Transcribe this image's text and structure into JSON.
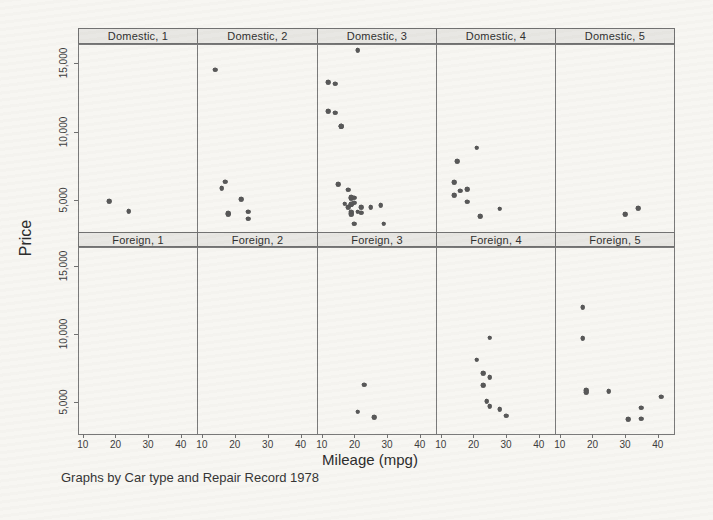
{
  "chart_data": {
    "type": "scatter",
    "xlabel": "Mileage (mpg)",
    "ylabel": "Price",
    "caption": "Graphs by Car type and Repair Record 1978",
    "x_ticks": [
      10,
      20,
      30,
      40
    ],
    "y_ticks": [
      5000,
      10000,
      15000
    ],
    "y_tick_labels": [
      "5,000",
      "10,000",
      "15,000"
    ],
    "xlim": [
      8.5,
      45
    ],
    "ylim": [
      2700,
      16400
    ],
    "grid": false,
    "legend": "none",
    "facet_rows": [
      "Domestic",
      "Foreign"
    ],
    "facet_cols": [
      "1",
      "2",
      "3",
      "4",
      "5"
    ],
    "facets": [
      {
        "label": "Domestic, 1",
        "row": 0,
        "col": 0,
        "points": [
          [
            18,
            4934
          ],
          [
            24,
            4195
          ]
        ]
      },
      {
        "label": "Domestic, 2",
        "row": 0,
        "col": 1,
        "points": [
          [
            14,
            14500
          ],
          [
            22,
            5104
          ],
          [
            24,
            3667
          ],
          [
            18,
            4010
          ],
          [
            16,
            5886
          ],
          [
            17,
            6342
          ],
          [
            18,
            4060
          ],
          [
            24,
            4172
          ]
        ]
      },
      {
        "label": "Domestic, 3",
        "row": 0,
        "col": 2,
        "points": [
          [
            22,
            4099
          ],
          [
            17,
            4749
          ],
          [
            20,
            4816
          ],
          [
            18,
            5788
          ],
          [
            20,
            5189
          ],
          [
            16,
            10372
          ],
          [
            19,
            4082
          ],
          [
            14,
            11385
          ],
          [
            21,
            15906
          ],
          [
            29,
            3299
          ],
          [
            22,
            4504
          ],
          [
            19,
            3955
          ],
          [
            21,
            4187
          ],
          [
            12,
            11497
          ],
          [
            12,
            13594
          ],
          [
            14,
            13466
          ],
          [
            15,
            6165
          ],
          [
            18,
            4516
          ],
          [
            20,
            3291
          ],
          [
            19,
            4733
          ],
          [
            19,
            5172
          ],
          [
            19,
            4181
          ],
          [
            16,
            10371
          ],
          [
            28,
            4647
          ],
          [
            25,
            4482
          ],
          [
            19,
            5222
          ],
          [
            19,
            4723
          ]
        ]
      },
      {
        "label": "Domestic, 4",
        "row": 0,
        "col": 3,
        "points": [
          [
            15,
            7827
          ],
          [
            16,
            5705
          ],
          [
            28,
            4389
          ],
          [
            22,
            3829
          ],
          [
            14,
            5379
          ],
          [
            14,
            6303
          ],
          [
            21,
            8814
          ],
          [
            18,
            4890
          ],
          [
            18,
            5798
          ]
        ]
      },
      {
        "label": "Domestic, 5",
        "row": 0,
        "col": 4,
        "points": [
          [
            30,
            3984
          ],
          [
            34,
            4425
          ]
        ]
      },
      {
        "label": "Foreign, 1",
        "row": 1,
        "col": 0,
        "points": []
      },
      {
        "label": "Foreign, 2",
        "row": 1,
        "col": 1,
        "points": []
      },
      {
        "label": "Foreign, 3",
        "row": 1,
        "col": 2,
        "points": [
          [
            23,
            6295
          ],
          [
            21,
            4296
          ],
          [
            26,
            3895
          ]
        ]
      },
      {
        "label": "Foreign, 4",
        "row": 1,
        "col": 3,
        "points": [
          [
            25,
            9735
          ],
          [
            23,
            6229
          ],
          [
            24,
            5079
          ],
          [
            21,
            8129
          ],
          [
            28,
            4499
          ],
          [
            30,
            3995
          ],
          [
            23,
            7140
          ],
          [
            25,
            4697
          ],
          [
            25,
            6850
          ]
        ]
      },
      {
        "label": "Foreign, 5",
        "row": 1,
        "col": 4,
        "points": [
          [
            17,
            9690
          ],
          [
            35,
            4589
          ],
          [
            25,
            5799
          ],
          [
            35,
            3798
          ],
          [
            18,
            5899
          ],
          [
            31,
            3748
          ],
          [
            18,
            5719
          ],
          [
            41,
            5397
          ],
          [
            17,
            11995
          ]
        ]
      }
    ]
  },
  "colors": {
    "background": "#f7f6f2",
    "dot": "#565656",
    "panel_border": "#787878",
    "header_fill": "#e8e7e3",
    "text": "#2e2e2e"
  }
}
